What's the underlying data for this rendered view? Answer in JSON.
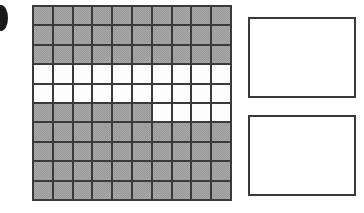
{
  "canvas": {
    "width": 364,
    "height": 213,
    "background_color": "#ffffff"
  },
  "edge_marker": {
    "name": "clipped dark ellipse at left edge",
    "color": "#1a1a1a",
    "x": -6,
    "y": 5,
    "width": 14,
    "height": 26
  },
  "grid": {
    "label": "10 by 10 shaded square grid",
    "x": 32,
    "y": 5,
    "width": 200,
    "height": 196,
    "rows": 10,
    "columns": 10,
    "line_color": "#3a3a3a",
    "gray_color": "#a8a8a8",
    "white_color": "#fdfdfd",
    "gray_count": 64,
    "white_count": 36,
    "cells": [
      [
        "gray",
        "gray",
        "gray",
        "gray",
        "gray",
        "gray",
        "gray",
        "gray",
        "gray",
        "gray"
      ],
      [
        "gray",
        "gray",
        "gray",
        "gray",
        "gray",
        "gray",
        "gray",
        "gray",
        "gray",
        "gray"
      ],
      [
        "gray",
        "gray",
        "gray",
        "gray",
        "gray",
        "gray",
        "gray",
        "gray",
        "gray",
        "gray"
      ],
      [
        "white",
        "white",
        "white",
        "white",
        "white",
        "white",
        "white",
        "white",
        "white",
        "white"
      ],
      [
        "white",
        "white",
        "white",
        "white",
        "white",
        "white",
        "white",
        "white",
        "white",
        "white"
      ],
      [
        "gray",
        "gray",
        "gray",
        "gray",
        "gray",
        "gray",
        "white",
        "white",
        "white",
        "white"
      ],
      [
        "gray",
        "gray",
        "gray",
        "gray",
        "gray",
        "gray",
        "gray",
        "gray",
        "gray",
        "gray"
      ],
      [
        "gray",
        "gray",
        "gray",
        "gray",
        "gray",
        "gray",
        "gray",
        "gray",
        "gray",
        "gray"
      ],
      [
        "gray",
        "gray",
        "gray",
        "gray",
        "gray",
        "gray",
        "gray",
        "gray",
        "gray",
        "gray"
      ],
      [
        "gray",
        "gray",
        "gray",
        "gray",
        "gray",
        "gray",
        "gray",
        "gray",
        "gray",
        "gray"
      ]
    ]
  },
  "side_boxes": [
    {
      "label": "empty answer box top",
      "x": 248,
      "y": 17,
      "width": 108,
      "height": 81,
      "border_color": "#3a3a3a",
      "fill_color": "#ffffff",
      "content": ""
    },
    {
      "label": "empty answer box bottom",
      "x": 248,
      "y": 115,
      "width": 108,
      "height": 81,
      "border_color": "#3a3a3a",
      "fill_color": "#ffffff",
      "content": ""
    }
  ]
}
